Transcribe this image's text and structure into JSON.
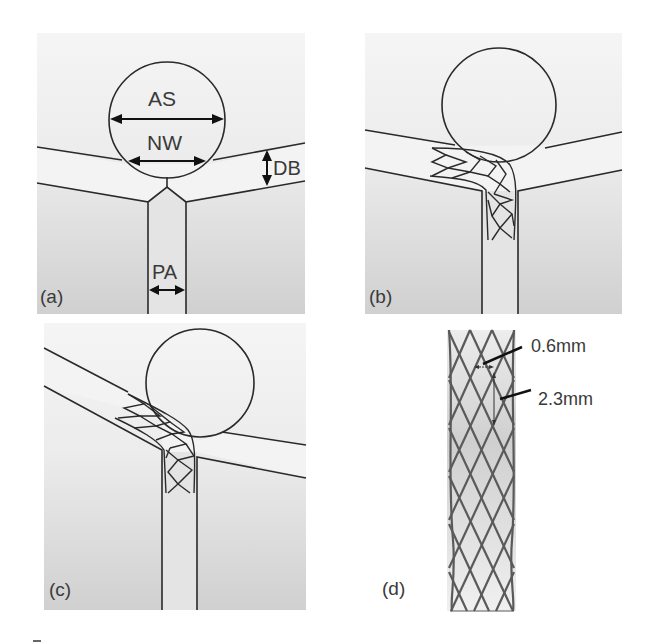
{
  "figure": {
    "panels": [
      {
        "id": "a",
        "label": "(a)",
        "description": "Bifurcation geometry with aneurysm and dimension annotations",
        "annotations": {
          "aneurysm_size": "AS",
          "neck_width": "NW",
          "daughter_branch": "DB",
          "parent_artery": "PA"
        }
      },
      {
        "id": "b",
        "label": "(b)",
        "description": "Stent deployed from parent artery into left daughter branch (moderate angle)"
      },
      {
        "id": "c",
        "label": "(c)",
        "description": "Stent deployed into steeply angled left daughter branch"
      },
      {
        "id": "d",
        "label": "(d)",
        "description": "Stent mesh detail with strut dimensions",
        "annotations": {
          "strut_width": "0.6mm",
          "cell_length": "2.3mm"
        }
      }
    ],
    "colors": {
      "background": "#ffffff",
      "panel_top": "#f4f4f4",
      "panel_bottom": "#d2d2d2",
      "line": "#2a2a2a",
      "stent": "#555555",
      "text": "#3a3a3a"
    }
  }
}
